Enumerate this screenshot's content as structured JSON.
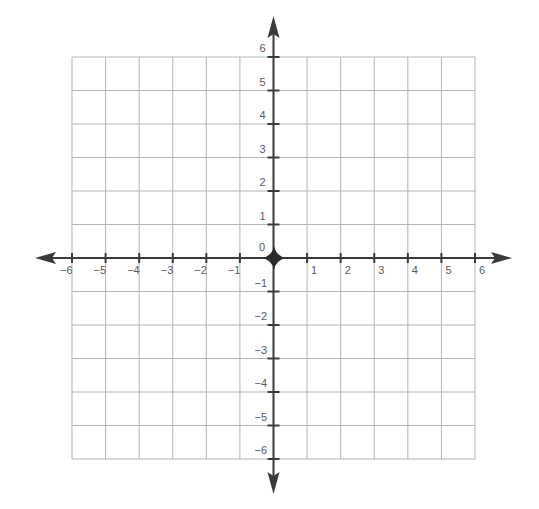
{
  "chart_data": {
    "type": "coordinate-grid",
    "title": "",
    "xlabel": "",
    "ylabel": "",
    "xlim": [
      -6,
      6
    ],
    "ylim": [
      -6,
      6
    ],
    "grid": true,
    "x_ticks": [
      -6,
      -5,
      -4,
      -3,
      -2,
      -1,
      1,
      2,
      3,
      4,
      5,
      6
    ],
    "y_ticks": [
      -6,
      -5,
      -4,
      -3,
      -2,
      -1,
      1,
      2,
      3,
      4,
      5,
      6
    ],
    "x_tick_labels": [
      "−6",
      "−5",
      "−4",
      "−3",
      "−2",
      "−1",
      "1",
      "2",
      "3",
      "4",
      "5",
      "6"
    ],
    "y_tick_labels": [
      "−6",
      "−5",
      "−4",
      "−3",
      "−2",
      "−1",
      "1",
      "2",
      "3",
      "4",
      "5",
      "6"
    ],
    "origin_label": "0",
    "points": [
      {
        "x": 0,
        "y": 0,
        "marker": "origin-star"
      }
    ]
  },
  "colors": {
    "grid": "#b4b4b4",
    "axis": "#3a3a3a",
    "label": "#5a5a5a",
    "background": "#ffffff"
  }
}
